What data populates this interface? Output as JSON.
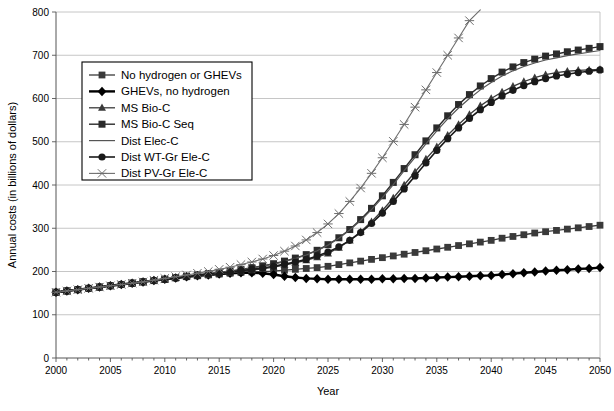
{
  "chart_data": {
    "type": "line",
    "title": "",
    "xlabel": "Year",
    "ylabel": "Annual costs (in billions of dollars)",
    "xlim": [
      2000,
      2050
    ],
    "ylim": [
      0,
      800
    ],
    "xticks": [
      2000,
      2005,
      2010,
      2015,
      2020,
      2025,
      2030,
      2035,
      2040,
      2045,
      2050
    ],
    "xticklabels": [
      "2000",
      "2005",
      "2010",
      "2015",
      "2020",
      "2025",
      "2030",
      "2035",
      "2040",
      "2045",
      "2050"
    ],
    "yticks": [
      0,
      100,
      200,
      300,
      400,
      500,
      600,
      700,
      800
    ],
    "yticklabels": [
      "0",
      "100",
      "200",
      "300",
      "400",
      "500",
      "600",
      "700",
      "800"
    ],
    "minor_xtick_interval": 1,
    "grid": "horizontal",
    "legend_position": "upper-left-inside",
    "x": [
      2000,
      2001,
      2002,
      2003,
      2004,
      2005,
      2006,
      2007,
      2008,
      2009,
      2010,
      2011,
      2012,
      2013,
      2014,
      2015,
      2016,
      2017,
      2018,
      2019,
      2020,
      2021,
      2022,
      2023,
      2024,
      2025,
      2026,
      2027,
      2028,
      2029,
      2030,
      2031,
      2032,
      2033,
      2034,
      2035,
      2036,
      2037,
      2038,
      2039,
      2040,
      2041,
      2042,
      2043,
      2044,
      2045,
      2046,
      2047,
      2048,
      2049,
      2050
    ],
    "series": [
      {
        "name": "No hydrogen or GHEVs",
        "marker": "square",
        "color": "#3a3a3a",
        "linewidth": 1.3,
        "markersize": 3.4,
        "values": [
          152,
          155,
          158,
          161,
          164,
          167,
          170,
          173,
          176,
          179,
          182,
          185,
          188,
          190,
          192,
          194,
          196,
          198,
          199,
          200,
          201,
          203,
          205,
          207,
          209,
          212,
          216,
          220,
          224,
          228,
          232,
          236,
          240,
          244,
          248,
          252,
          256,
          260,
          264,
          268,
          272,
          277,
          281,
          285,
          289,
          292,
          295,
          298,
          301,
          304,
          307
        ]
      },
      {
        "name": "GHEVs, no hydrogen",
        "marker": "diamond",
        "color": "#000000",
        "linewidth": 2.4,
        "markersize": 3.8,
        "values": [
          152,
          155,
          158,
          161,
          164,
          167,
          170,
          173,
          176,
          179,
          182,
          185,
          188,
          190,
          192,
          194,
          196,
          197,
          197,
          196,
          193,
          189,
          186,
          184,
          183,
          182,
          182,
          182,
          182,
          182,
          183,
          183,
          184,
          184,
          185,
          186,
          187,
          188,
          189,
          190,
          191,
          193,
          195,
          197,
          199,
          201,
          203,
          204,
          206,
          207,
          209
        ]
      },
      {
        "name": "MS Bio-C",
        "marker": "triangle",
        "color": "#3a3a3a",
        "linewidth": 1.3,
        "markersize": 3.6,
        "values": [
          152,
          155,
          158,
          161,
          164,
          167,
          170,
          173,
          176,
          179,
          182,
          185,
          188,
          190,
          192,
          195,
          197,
          200,
          203,
          206,
          210,
          215,
          220,
          226,
          233,
          242,
          255,
          272,
          292,
          315,
          341,
          370,
          400,
          430,
          460,
          488,
          515,
          540,
          563,
          583,
          600,
          615,
          628,
          639,
          648,
          655,
          660,
          663,
          665,
          666,
          667
        ]
      },
      {
        "name": "MS Bio-C Seq",
        "marker": "square",
        "color": "#2b2b2b",
        "linewidth": 1.4,
        "markersize": 3.5,
        "values": [
          152,
          155,
          158,
          161,
          164,
          167,
          170,
          173,
          176,
          179,
          182,
          186,
          189,
          192,
          195,
          198,
          201,
          205,
          209,
          213,
          218,
          224,
          231,
          239,
          249,
          262,
          278,
          297,
          320,
          346,
          375,
          406,
          438,
          470,
          502,
          532,
          560,
          586,
          609,
          629,
          646,
          661,
          673,
          683,
          691,
          698,
          703,
          708,
          712,
          716,
          720
        ]
      },
      {
        "name": "Dist Elec-C",
        "marker": "none",
        "color": "#555555",
        "linewidth": 1.2,
        "markersize": 0,
        "values": [
          152,
          155,
          158,
          161,
          164,
          167,
          170,
          173,
          176,
          179,
          182,
          186,
          189,
          192,
          195,
          198,
          201,
          204,
          208,
          212,
          217,
          223,
          230,
          238,
          248,
          261,
          277,
          296,
          318,
          343,
          371,
          401,
          433,
          464,
          495,
          525,
          553,
          578,
          600,
          620,
          637,
          652,
          664,
          674,
          682,
          689,
          694,
          699,
          703,
          707,
          711
        ]
      },
      {
        "name": "Dist WT-Gr Ele-C",
        "marker": "circle",
        "color": "#1a1a1a",
        "linewidth": 1.6,
        "markersize": 3.6,
        "values": [
          152,
          155,
          158,
          161,
          164,
          167,
          170,
          173,
          176,
          179,
          182,
          185,
          188,
          191,
          194,
          196,
          199,
          202,
          205,
          208,
          212,
          217,
          222,
          228,
          236,
          245,
          257,
          272,
          290,
          311,
          335,
          362,
          391,
          421,
          451,
          480,
          507,
          532,
          554,
          574,
          591,
          606,
          619,
          630,
          639,
          646,
          652,
          656,
          660,
          663,
          666
        ]
      },
      {
        "name": "Dist PV-Gr Ele-C",
        "marker": "star",
        "color": "#6e6e6e",
        "linewidth": 1.1,
        "markersize": 4.2,
        "values": [
          152,
          155,
          158,
          161,
          164,
          167,
          170,
          173,
          176,
          180,
          184,
          188,
          192,
          196,
          200,
          205,
          210,
          216,
          222,
          229,
          237,
          247,
          259,
          273,
          290,
          310,
          334,
          362,
          393,
          427,
          463,
          501,
          540,
          580,
          620,
          660,
          700,
          740,
          780,
          805,
          null,
          null,
          null,
          null,
          null,
          null,
          null,
          null,
          null,
          null,
          null
        ]
      }
    ]
  },
  "legend": {
    "entries": [
      {
        "label": "No hydrogen or GHEVs",
        "marker": "square"
      },
      {
        "label": "GHEVs, no hydrogen",
        "marker": "diamond"
      },
      {
        "label": "MS Bio-C",
        "marker": "triangle"
      },
      {
        "label": "MS Bio-C Seq",
        "marker": "square"
      },
      {
        "label": "Dist Elec-C",
        "marker": "none"
      },
      {
        "label": "Dist WT-Gr Ele-C",
        "marker": "circle"
      },
      {
        "label": "Dist PV-Gr Ele-C",
        "marker": "star"
      }
    ]
  }
}
